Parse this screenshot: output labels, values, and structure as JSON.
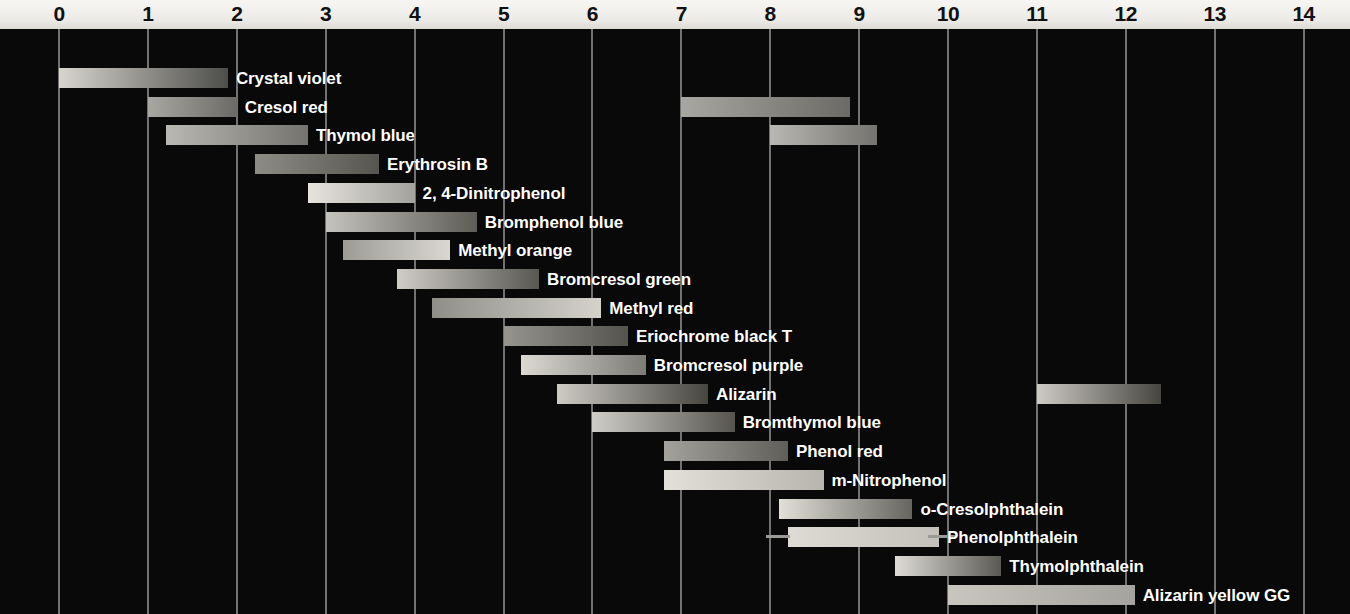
{
  "chart_data": {
    "type": "bar",
    "xlabel": "pH",
    "ylabel": "",
    "xlim": [
      0,
      14
    ],
    "grid": true,
    "legend": null,
    "axis_ticks": [
      "0",
      "1",
      "2",
      "3",
      "4",
      "5",
      "6",
      "7",
      "8",
      "9",
      "10",
      "11",
      "12",
      "13",
      "14"
    ],
    "series": [
      {
        "name": "Crystal violet",
        "label": "Crystal violet",
        "ranges": [
          [
            0.0,
            1.9
          ]
        ],
        "gradient": [
          "#d7d5ce",
          "#4d4d4a"
        ]
      },
      {
        "name": "Cresol red",
        "label": "Cresol red",
        "ranges": [
          [
            1.0,
            2.0
          ],
          [
            7.0,
            8.9
          ]
        ],
        "gradient": [
          "#a9a7a1",
          "#6b6a66"
        ]
      },
      {
        "name": "Thymol blue",
        "label": "Thymol blue",
        "ranges": [
          [
            1.2,
            2.8
          ],
          [
            8.0,
            9.2
          ]
        ],
        "gradient": [
          "#b9b8b2",
          "#74736f"
        ]
      },
      {
        "name": "Erythrosin B",
        "label": "Erythrosin B",
        "ranges": [
          [
            2.2,
            3.6
          ]
        ],
        "gradient": [
          "#8d8c87",
          "#56554f"
        ]
      },
      {
        "name": "2, 4-Dinitrophenol",
        "label": "2, 4-Dinitrophenol",
        "ranges": [
          [
            2.8,
            4.0
          ]
        ],
        "gradient": [
          "#e6e4dd",
          "#a3a29c"
        ]
      },
      {
        "name": "Bromphenol blue",
        "label": "Bromphenol blue",
        "ranges": [
          [
            3.0,
            4.7
          ]
        ],
        "gradient": [
          "#c5c3bd",
          "#5d5c57"
        ]
      },
      {
        "name": "Methyl orange",
        "label": "Methyl orange",
        "ranges": [
          [
            3.2,
            4.4
          ]
        ],
        "gradient": [
          "#9c9b95",
          "#d9d7d0"
        ]
      },
      {
        "name": "Bromcresol green",
        "label": "Bromcresol green",
        "ranges": [
          [
            3.8,
            5.4
          ]
        ],
        "gradient": [
          "#cfcdc6",
          "#585751"
        ]
      },
      {
        "name": "Methyl red",
        "label": "Methyl red",
        "ranges": [
          [
            4.2,
            6.1
          ]
        ],
        "gradient": [
          "#8f8e88",
          "#d4d2cb"
        ]
      },
      {
        "name": "Eriochrome black T",
        "label": "Eriochrome black T",
        "ranges": [
          [
            5.0,
            6.4
          ]
        ],
        "gradient": [
          "#95948e",
          "#54534e"
        ]
      },
      {
        "name": "Bromcresol purple",
        "label": "Bromcresol purple",
        "ranges": [
          [
            5.2,
            6.6
          ]
        ],
        "gradient": [
          "#dbd9d2",
          "#7c7b76"
        ]
      },
      {
        "name": "Alizarin",
        "label": "Alizarin",
        "ranges": [
          [
            5.6,
            7.3
          ],
          [
            11.0,
            12.4
          ]
        ],
        "gradient": [
          "#cdcbc4",
          "#46453f"
        ]
      },
      {
        "name": "Bromthymol blue",
        "label": "Bromthymol blue",
        "ranges": [
          [
            6.0,
            7.6
          ]
        ],
        "gradient": [
          "#cecdc6",
          "#55544f"
        ]
      },
      {
        "name": "Phenol red",
        "label": "Phenol red",
        "ranges": [
          [
            6.8,
            8.2
          ]
        ],
        "gradient": [
          "#a3a29c",
          "#5f5e59"
        ]
      },
      {
        "name": "m-Nitrophenol",
        "label": "m-Nitrophenol",
        "ranges": [
          [
            6.8,
            8.6
          ]
        ],
        "gradient": [
          "#e2e0d9",
          "#b7b5ae"
        ]
      },
      {
        "name": "o-Cresolphthalein",
        "label": "o-Cresolphthalein",
        "ranges": [
          [
            8.1,
            9.6
          ]
        ],
        "gradient": [
          "#e1dfd8",
          "#66655f"
        ]
      },
      {
        "name": "Phenolphthalein",
        "label": "Phenolphthalein",
        "ranges": [
          [
            8.2,
            9.9
          ]
        ],
        "gradient": [
          "#dddbd4",
          "#c3c1ba"
        ]
      },
      {
        "name": "Thymolphthalein",
        "label": "Thymolphthalein",
        "ranges": [
          [
            9.4,
            10.6
          ]
        ],
        "gradient": [
          "#dedcd5",
          "#5a5954"
        ]
      },
      {
        "name": "Alizarin yellow GG",
        "label": "Alizarin yellow GG",
        "ranges": [
          [
            10.0,
            12.1
          ]
        ],
        "gradient": [
          "#c8c6bf",
          "#a5a39d"
        ]
      }
    ]
  },
  "colors": {
    "plot_background": "#090909",
    "axis_background": "#efede9",
    "gridline": "#8d8d8d",
    "label_text": "#ffffff",
    "tick_text": "#111111"
  }
}
